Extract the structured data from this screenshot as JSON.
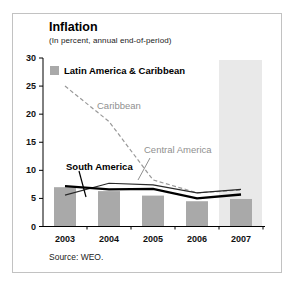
{
  "figure": {
    "title": "Inflation",
    "subtitle": "(In percent, annual end-of-period)",
    "source": "Source: WEO."
  },
  "chart_data": {
    "type": "bar",
    "subtype": "bar-and-line combo",
    "title": "Inflation",
    "subtitle": "(In percent, annual end-of-period)",
    "xlabel": "",
    "ylabel": "",
    "categories": [
      "2003",
      "2004",
      "2005",
      "2006",
      "2007"
    ],
    "bar_series": {
      "name": "Latin America & Caribbean",
      "color": "#a9a9a9",
      "values": [
        7.0,
        6.3,
        5.5,
        4.5,
        4.9
      ]
    },
    "series": [
      {
        "name": "Caribbean",
        "style": "dashed",
        "color": "#999999",
        "values": [
          25.0,
          18.7,
          8.3,
          6.0,
          6.5
        ]
      },
      {
        "name": "Central America",
        "style": "solid",
        "color": "#2a2a2a",
        "values": [
          5.6,
          7.7,
          7.4,
          6.0,
          6.6
        ]
      },
      {
        "name": "South America",
        "style": "solid-bold",
        "color": "#000000",
        "values": [
          7.2,
          6.6,
          6.7,
          5.0,
          5.7
        ]
      }
    ],
    "ylim": [
      0,
      30
    ],
    "yticks": [
      0,
      5,
      10,
      15,
      20,
      25,
      30
    ],
    "grid": "off",
    "legend": {
      "label": "Latin America & Caribbean",
      "position": "top-left"
    },
    "forecast_band": {
      "category": "2007",
      "color": "#e9e9e9"
    },
    "source": "Source: WEO."
  }
}
